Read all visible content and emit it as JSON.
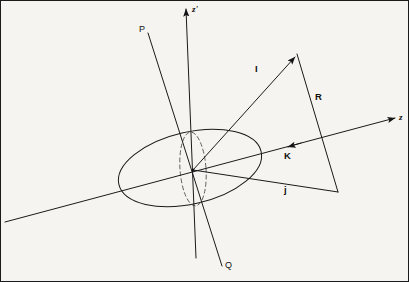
{
  "figure": {
    "type": "vector-geometry-diagram",
    "background_color": "#f6f4f0",
    "stroke_color": "#1a1a1a",
    "width": 409,
    "height": 282
  },
  "axes": [
    {
      "id": "z-prime",
      "label": "z'",
      "label_x": 192,
      "label_y": 6,
      "description": "near-vertical primed axis with arrowhead at top",
      "x1": 186,
      "y1": 7,
      "x2": 196,
      "y2": 258,
      "arrow_at": "start"
    },
    {
      "id": "z",
      "label": "z",
      "label_x": 399,
      "label_y": 117,
      "description": "oblique axis running lower-left to upper-right with arrowhead at right",
      "x1": 5,
      "y1": 222,
      "x2": 397,
      "y2": 118,
      "arrow_at": "end"
    }
  ],
  "rays": [
    {
      "id": "pq-line",
      "start_label": "P",
      "end_label": "Q",
      "start_label_x": 141,
      "start_label_y": 28,
      "end_label_x": 226,
      "end_label_y": 265,
      "x1": 148,
      "y1": 33,
      "x2": 222,
      "y2": 266
    }
  ],
  "vectors": [
    {
      "id": "I",
      "label": "I",
      "label_x": 256,
      "label_y": 69,
      "description": "vector from origin to triangle apex, arrowhead at apex",
      "x1": 193,
      "y1": 170,
      "x2": 296,
      "y2": 55,
      "arrow_at": "end"
    },
    {
      "id": "R",
      "label": "R",
      "label_x": 316,
      "label_y": 97,
      "description": "triangle side from apex down to lower right vertex",
      "x1": 297,
      "y1": 54,
      "x2": 338,
      "y2": 192,
      "arrow_at": "none"
    },
    {
      "id": "j",
      "label": "j",
      "label_x": 285,
      "label_y": 190,
      "description": "triangle base from origin to lower right vertex",
      "x1": 193,
      "y1": 170,
      "x2": 338,
      "y2": 192,
      "arrow_at": "none"
    },
    {
      "id": "K",
      "label": "K",
      "label_x": 285,
      "label_y": 156,
      "description": "arrowhead on the z axis pointing toward the origin",
      "arrow_x": 292,
      "arrow_y": 146,
      "arrow_at": "midpoint-of-z-axis"
    }
  ],
  "shapes": [
    {
      "id": "orbit-ellipse",
      "style": "solid",
      "description": "large tilted ellipse representing the disc / orbital plane",
      "cx": 190,
      "cy": 168,
      "rx": 73,
      "ry": 36,
      "rotation": -13
    },
    {
      "id": "edge-on-circle",
      "style": "dashed",
      "description": "narrow dashed ellipse: a circle seen nearly edge-on",
      "cx": 193,
      "cy": 169,
      "rx": 13,
      "ry": 37,
      "rotation": -4
    }
  ],
  "markers": [
    {
      "id": "origin",
      "x": 193,
      "y": 170,
      "description": "common origin where all lines converge"
    },
    {
      "id": "apex",
      "x": 297,
      "y": 54,
      "description": "triangle apex / tip of vector I"
    },
    {
      "id": "lower-right-vertex",
      "x": 338,
      "y": 192,
      "description": "triangle lower right vertex"
    }
  ]
}
